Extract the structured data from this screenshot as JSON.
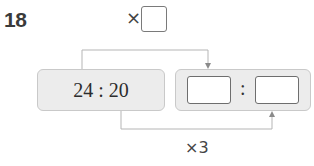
{
  "question": {
    "number": "18"
  },
  "top_operation": {
    "operator": "×",
    "blank_value": ""
  },
  "left_ratio": {
    "text": "24 : 20",
    "first_term": "24",
    "second_term": "20"
  },
  "right_ratio": {
    "first_blank": "",
    "separator": ":",
    "second_blank": ""
  },
  "bottom_operation": {
    "label": "×3"
  },
  "colors": {
    "box_fill": "#ececec",
    "box_border": "#c9c9c9",
    "line": "#b5b5b5",
    "text": "#2d2d2d"
  }
}
